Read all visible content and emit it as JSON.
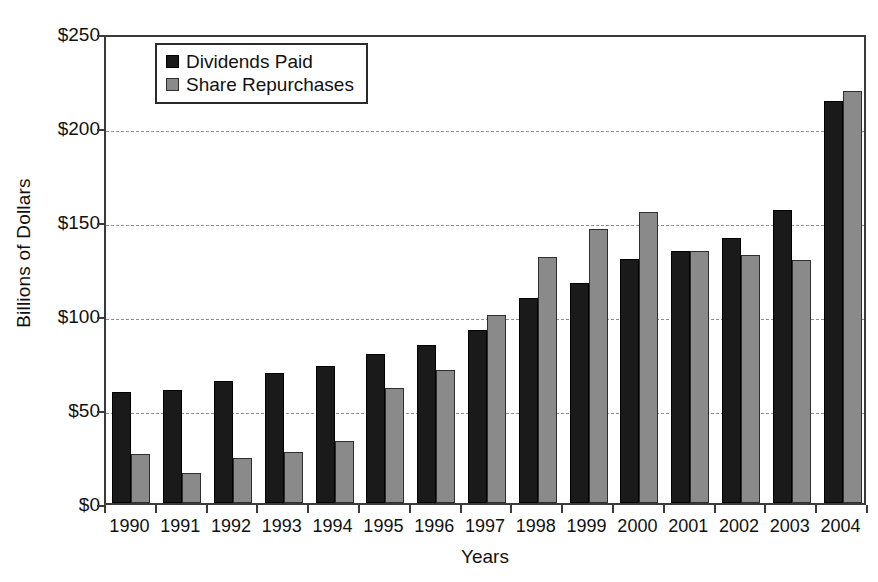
{
  "chart_data": {
    "type": "bar",
    "title": "",
    "xlabel": "Years",
    "ylabel": "Billions of Dollars",
    "categories": [
      "1990",
      "1991",
      "1992",
      "1993",
      "1994",
      "1995",
      "1996",
      "1997",
      "1998",
      "1999",
      "2000",
      "2001",
      "2002",
      "2003",
      "2004"
    ],
    "series": [
      {
        "name": "Dividends Paid",
        "color": "#1a1a1a",
        "values": [
          59,
          60,
          65,
          69,
          73,
          79,
          84,
          92,
          109,
          117,
          130,
          134,
          141,
          156,
          214
        ]
      },
      {
        "name": "Share Repurchases",
        "color": "#8a8a8a",
        "values": [
          26,
          16,
          24,
          27,
          33,
          61,
          71,
          100,
          131,
          146,
          155,
          134,
          132,
          129,
          219
        ]
      }
    ],
    "ylim": [
      0,
      250
    ],
    "ytick_values": [
      0,
      50,
      100,
      150,
      200,
      250
    ],
    "ytick_labels": [
      "$0",
      "$50",
      "$100",
      "$150",
      "$200",
      "$250"
    ],
    "grid": "horizontal-dashed",
    "legend_position": "top-left-inside",
    "axis_color": "#3a3a3a",
    "grid_color": "#8f8f8f",
    "background": "#ffffff"
  }
}
